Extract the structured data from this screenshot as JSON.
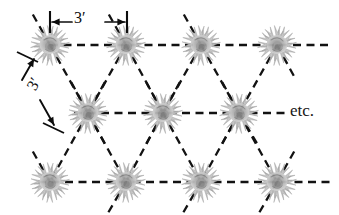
{
  "figure": {
    "labels": {
      "horizontal_spacing": "3′",
      "diagonal_spacing": "3′",
      "continuation": "etc."
    },
    "colors": {
      "background": "#ffffff",
      "line": "#0d0d0d",
      "plant_light": "#cccccc",
      "plant_mid": "#b0b0b0",
      "plant_dark": "#8f8f8f",
      "plant_core": "#787878",
      "text": "#101010"
    },
    "plant_radius": 21,
    "rows": [
      {
        "name": "top-row",
        "y": 45,
        "plants": [
          {
            "x": 50,
            "y": 45
          },
          {
            "x": 126,
            "y": 45
          },
          {
            "x": 201,
            "y": 45
          },
          {
            "x": 277,
            "y": 45
          }
        ]
      },
      {
        "name": "middle-row",
        "y": 113,
        "plants": [
          {
            "x": 88,
            "y": 113
          },
          {
            "x": 163,
            "y": 113
          },
          {
            "x": 239,
            "y": 113
          }
        ]
      },
      {
        "name": "bottom-row",
        "y": 182,
        "plants": [
          {
            "x": 50,
            "y": 182
          },
          {
            "x": 126,
            "y": 182
          },
          {
            "x": 201,
            "y": 182
          },
          {
            "x": 277,
            "y": 182
          }
        ]
      }
    ],
    "horizontal_lines": [
      {
        "name": "top-row-line",
        "x1": 50,
        "y1": 45,
        "x2": 332,
        "y2": 45
      },
      {
        "name": "middle-row-line",
        "x1": 74,
        "y1": 113,
        "x2": 285,
        "y2": 113
      },
      {
        "name": "bottom-row-line",
        "x1": 38,
        "y1": 182,
        "x2": 332,
        "y2": 182
      }
    ],
    "diagonal_lines": [
      {
        "name": "diag-1",
        "x1": 50,
        "y1": 45,
        "x2": 88,
        "y2": 113
      },
      {
        "name": "diag-2",
        "x1": 126,
        "y1": 45,
        "x2": 88,
        "y2": 113
      },
      {
        "name": "diag-3",
        "x1": 126,
        "y1": 45,
        "x2": 163,
        "y2": 113
      },
      {
        "name": "diag-4",
        "x1": 201,
        "y1": 45,
        "x2": 163,
        "y2": 113
      },
      {
        "name": "diag-5",
        "x1": 201,
        "y1": 45,
        "x2": 239,
        "y2": 113
      },
      {
        "name": "diag-6",
        "x1": 277,
        "y1": 45,
        "x2": 239,
        "y2": 113
      },
      {
        "name": "diag-7",
        "x1": 88,
        "y1": 113,
        "x2": 50,
        "y2": 182
      },
      {
        "name": "diag-8",
        "x1": 88,
        "y1": 113,
        "x2": 126,
        "y2": 182
      },
      {
        "name": "diag-9",
        "x1": 163,
        "y1": 113,
        "x2": 126,
        "y2": 182
      },
      {
        "name": "diag-10",
        "x1": 163,
        "y1": 113,
        "x2": 201,
        "y2": 182
      },
      {
        "name": "diag-11",
        "x1": 239,
        "y1": 113,
        "x2": 201,
        "y2": 182
      },
      {
        "name": "diag-12",
        "x1": 239,
        "y1": 113,
        "x2": 277,
        "y2": 182
      },
      {
        "name": "diag-13-stub",
        "x1": 277,
        "y1": 45,
        "x2": 295,
        "y2": 78
      },
      {
        "name": "diag-14-stub",
        "x1": 239,
        "y1": 113,
        "x2": 258,
        "y2": 145
      },
      {
        "name": "diag-15-stub",
        "x1": 277,
        "y1": 182,
        "x2": 295,
        "y2": 150
      },
      {
        "name": "diag-16-stub",
        "x1": 50,
        "y1": 45,
        "x2": 32,
        "y2": 13
      },
      {
        "name": "diag-17-stub",
        "x1": 88,
        "y1": 113,
        "x2": 70,
        "y2": 80
      },
      {
        "name": "diag-18-stub",
        "x1": 50,
        "y1": 182,
        "x2": 32,
        "y2": 150
      },
      {
        "name": "diag-19-stub",
        "x1": 126,
        "y1": 45,
        "x2": 108,
        "y2": 13
      },
      {
        "name": "diag-20-stub",
        "x1": 201,
        "y1": 45,
        "x2": 183,
        "y2": 13
      },
      {
        "name": "diag-21-stub",
        "x1": 163,
        "y1": 113,
        "x2": 145,
        "y2": 80
      },
      {
        "name": "diag-22-stub",
        "x1": 126,
        "y1": 182,
        "x2": 108,
        "y2": 213
      },
      {
        "name": "diag-23-stub",
        "x1": 201,
        "y1": 182,
        "x2": 183,
        "y2": 213
      },
      {
        "name": "diag-24-stub",
        "x1": 277,
        "y1": 182,
        "x2": 259,
        "y2": 213
      },
      {
        "name": "diag-25-stub",
        "x1": 88,
        "y1": 113,
        "x2": 106,
        "y2": 80
      },
      {
        "name": "diag-26-stub",
        "x1": 163,
        "y1": 113,
        "x2": 181,
        "y2": 80
      },
      {
        "name": "diag-27-stub",
        "x1": 239,
        "y1": 113,
        "x2": 221,
        "y2": 80
      },
      {
        "name": "diag-28-stub",
        "x1": 88,
        "y1": 113,
        "x2": 106,
        "y2": 146
      },
      {
        "name": "diag-29-stub",
        "x1": 163,
        "y1": 113,
        "x2": 145,
        "y2": 146
      },
      {
        "name": "diag-30-stub",
        "x1": 239,
        "y1": 113,
        "x2": 221,
        "y2": 146
      }
    ],
    "dimension_horizontal": {
      "name": "horizontal-3ft-dimension",
      "tick_left_x": 50,
      "tick_right_x": 127,
      "tick_top_y": 11,
      "tick_bottom_y": 33,
      "arrow_y": 22,
      "arrow_left_from": 72,
      "arrow_left_to": 52,
      "arrow_right_from": 105,
      "arrow_right_to": 125
    },
    "dimension_diagonal": {
      "name": "diagonal-3ft-dimension",
      "tick_upper": {
        "x1": 17,
        "y1": 52,
        "x2": 38,
        "y2": 62
      },
      "tick_lower": {
        "x1": 43,
        "y1": 123,
        "x2": 64,
        "y2": 133
      },
      "arrow_upper_from": {
        "x": 22,
        "y": 80
      },
      "arrow_upper_to": {
        "x": 34,
        "y": 59
      },
      "arrow_lower_from": {
        "x": 40,
        "y": 100
      },
      "arrow_lower_to": {
        "x": 54,
        "y": 125
      }
    }
  }
}
